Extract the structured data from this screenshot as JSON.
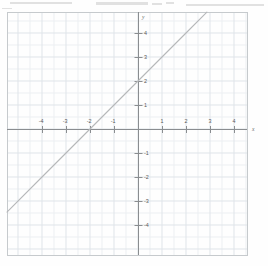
{
  "figure": {
    "kind": "scanned-graph-paper",
    "frame": {
      "left": 7,
      "top": 12,
      "right": 247,
      "bottom": 255
    },
    "origin": {
      "x": 138,
      "y": 129
    },
    "unit_px": 24,
    "colors": {
      "paper": "#fefefe",
      "minor_grid": "#eceff2",
      "major_grid": "#dfe4e9",
      "frame": "#c6cacd",
      "axis": "#8a8d90",
      "line": "#b6b8ba",
      "label": "#585858",
      "smudge": "#c9c9c9"
    }
  },
  "artifacts": [
    {
      "x": 10,
      "y": 2,
      "w": 62,
      "h": 2
    },
    {
      "x": 96,
      "y": 2,
      "w": 52,
      "h": 3
    },
    {
      "x": 152,
      "y": 3,
      "w": 10,
      "h": 2
    },
    {
      "x": 166,
      "y": 2,
      "w": 8,
      "h": 2
    },
    {
      "x": 186,
      "y": 4,
      "w": 78,
      "h": 2
    },
    {
      "x": 2,
      "y": 8,
      "w": 10,
      "h": 1
    }
  ],
  "axes": {
    "x_name": "x",
    "y_name": "y",
    "x_name_pos": {
      "x": 252,
      "y": 126
    },
    "y_name_pos": {
      "x": 142,
      "y": 14
    },
    "xlim": [
      -5.46,
      4.54
    ],
    "ylim": [
      -5.25,
      4.87
    ]
  },
  "x_ticks": [
    {
      "value": -4,
      "label": "-4"
    },
    {
      "value": -3,
      "label": "-3"
    },
    {
      "value": -2,
      "label": "-2"
    },
    {
      "value": -1,
      "label": "-1"
    },
    {
      "value": 1,
      "label": "1"
    },
    {
      "value": 2,
      "label": "2"
    },
    {
      "value": 3,
      "label": "3"
    },
    {
      "value": 4,
      "label": "4"
    }
  ],
  "y_ticks": [
    {
      "value": 4,
      "label": "4"
    },
    {
      "value": 3,
      "label": "3"
    },
    {
      "value": 2,
      "label": "2"
    },
    {
      "value": 1,
      "label": "1"
    },
    {
      "value": -1,
      "label": "-1"
    },
    {
      "value": -2,
      "label": "-2"
    },
    {
      "value": -3,
      "label": "-3"
    },
    {
      "value": -4,
      "label": "-4"
    }
  ],
  "chart_data": {
    "type": "line",
    "title": "",
    "xlabel": "x",
    "ylabel": "y",
    "xlim": [
      -5.46,
      4.54
    ],
    "ylim": [
      -5.25,
      4.87
    ],
    "grid": true,
    "grid_minor_step": 0.5,
    "grid_major_step": 1,
    "legend": "none",
    "series": [
      {
        "name": "y = x + 2",
        "equation": "y = x + 2",
        "slope": 1,
        "intercept": 2,
        "x_intercept": -2,
        "y_intercept": 2,
        "color": "#b6b8ba",
        "points": [
          {
            "x": -5.46,
            "y": -3.46
          },
          {
            "x": -4,
            "y": -2
          },
          {
            "x": -3,
            "y": -1
          },
          {
            "x": -2,
            "y": 0
          },
          {
            "x": -1,
            "y": 1
          },
          {
            "x": 0,
            "y": 2
          },
          {
            "x": 1,
            "y": 3
          },
          {
            "x": 2,
            "y": 4
          },
          {
            "x": 2.87,
            "y": 4.87
          }
        ]
      }
    ]
  }
}
